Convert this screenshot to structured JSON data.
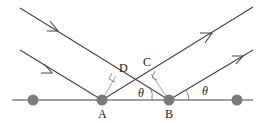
{
  "diagram": {
    "type": "wave reflection geometry (Bragg diffraction)",
    "colors": {
      "line": "#444444",
      "construction_line": "#777777",
      "atom": "#7a7a7a",
      "text": "#222222",
      "background": "#ffffff"
    },
    "labels": {
      "A": "A",
      "B": "B",
      "C": "C",
      "D": "D",
      "theta_left": "θ",
      "theta_right": "θ"
    },
    "atoms": [
      {
        "name": "atom-1",
        "x": 33,
        "y": 100
      },
      {
        "name": "atom-A",
        "x": 102,
        "y": 100
      },
      {
        "name": "atom-B",
        "x": 169,
        "y": 100
      },
      {
        "name": "atom-4",
        "x": 237,
        "y": 100
      }
    ]
  }
}
